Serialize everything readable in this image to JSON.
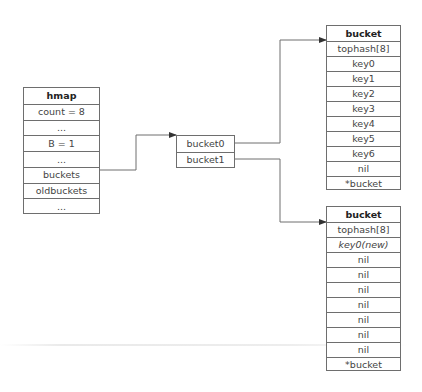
{
  "diagram": {
    "hmap": {
      "title": "hmap",
      "fields": [
        "count = 8",
        "...",
        "B = 1",
        "...",
        "buckets",
        "oldbuckets",
        "..."
      ]
    },
    "bucket_array": {
      "entries": [
        "bucket0",
        "bucket1"
      ]
    },
    "buckets": [
      {
        "title": "bucket",
        "fields": [
          "tophash[8]",
          "key0",
          "key1",
          "key2",
          "key3",
          "key4",
          "key5",
          "key6",
          "nil",
          "*bucket"
        ],
        "italic_fields": []
      },
      {
        "title": "bucket",
        "fields": [
          "tophash[8]",
          "key0(new)",
          "nil",
          "nil",
          "nil",
          "nil",
          "nil",
          "nil",
          "nil",
          "*bucket"
        ],
        "italic_fields": [
          "key0(new)"
        ]
      }
    ],
    "edges": [
      {
        "from": "hmap.buckets",
        "to": "bucket_array"
      },
      {
        "from": "bucket_array.bucket0",
        "to": "buckets.0"
      },
      {
        "from": "bucket_array.bucket1",
        "to": "buckets.1"
      }
    ],
    "colors": {
      "line": "#6e6e6e",
      "text": "#444444",
      "background": "#ffffff"
    }
  }
}
